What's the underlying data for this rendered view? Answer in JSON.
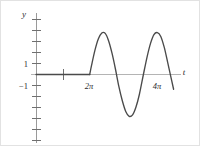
{
  "figure": {
    "caption": "Graph of a delayed sine wave that is zero until t = 2π",
    "background_color": "#ffffff",
    "border_color": "#e2e2e2"
  },
  "axes": {
    "x_axis": {
      "name": "t",
      "label": "t",
      "color": "#b4b4b4",
      "highlight_color": "#5a5a5a",
      "pixel_y": 73,
      "pixel_x_start": 30,
      "pixel_x_end": 180
    },
    "y_axis": {
      "name": "y",
      "label": "y",
      "color": "#9a9a9a",
      "pixel_x": 35,
      "pixel_y_start": 12,
      "pixel_y_end": 142
    }
  },
  "tick_labels": {
    "y_positive_one": "1",
    "y_negative_one": "−1",
    "x_two_pi": "2π",
    "x_four_pi": "4π"
  },
  "curve": {
    "name": "y = u(t - 2π) sin(t)",
    "color": "#4a4a4a",
    "stroke_width": 1.3,
    "flat_segment_color": "#4a4a4a"
  },
  "chart_data": {
    "type": "line",
    "title": "",
    "subtitle": "",
    "xlabel": "t",
    "ylabel": "y",
    "xlim": [
      0,
      17.2
    ],
    "ylim": [
      -2.4,
      3.4
    ],
    "grid": false,
    "legend": null,
    "xticks": [
      {
        "value": 3.14159,
        "label": ""
      },
      {
        "value": 6.28319,
        "label": "2π"
      },
      {
        "value": 12.56637,
        "label": "4π"
      }
    ],
    "yticks": [
      {
        "value": -2,
        "label": ""
      },
      {
        "value": -1,
        "label": "−1"
      },
      {
        "value": 0,
        "label": ""
      },
      {
        "value": 1,
        "label": "1"
      },
      {
        "value": 2,
        "label": ""
      },
      {
        "value": 3,
        "label": ""
      }
    ],
    "annotations": [
      {
        "text": "2π",
        "x": 6.28319,
        "y": -0.55
      },
      {
        "text": "4π",
        "x": 12.56637,
        "y": -0.55
      },
      {
        "text": "t",
        "x": 17.0,
        "y": 0.2
      },
      {
        "text": "y",
        "x": 0.15,
        "y": 3.25
      }
    ],
    "series": [
      {
        "name": "y = u(t - 2π) sin(t)",
        "color": "#4a4a4a",
        "x": [
          0.0,
          0.6,
          1.2,
          1.8,
          2.4,
          3.0,
          3.6,
          4.2,
          4.8,
          5.4,
          6.0,
          6.28319,
          6.5,
          6.9,
          7.3,
          7.7,
          8.1,
          8.5,
          8.9,
          9.3,
          9.7,
          10.1,
          10.5,
          10.9,
          11.3,
          11.7,
          12.1,
          12.56637,
          13.0,
          13.4,
          13.8,
          14.2,
          14.6,
          15.0,
          15.4,
          15.8,
          16.1
        ],
        "y": [
          0,
          0,
          0,
          0,
          0,
          0,
          0,
          0,
          0,
          0,
          0,
          0,
          0.216,
          0.579,
          0.85,
          0.989,
          0.978,
          0.798,
          0.501,
          0.125,
          -0.29,
          -0.625,
          -0.88,
          -0.995,
          -0.959,
          -0.772,
          -0.47,
          0.0,
          0.42,
          0.741,
          0.95,
          0.999,
          0.906,
          0.65,
          0.295,
          -0.075,
          -0.351
        ]
      }
    ]
  }
}
